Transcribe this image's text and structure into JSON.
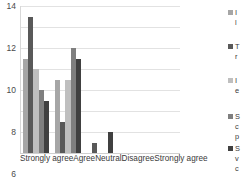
{
  "chart_data": {
    "type": "bar",
    "title": "",
    "subtitle": "",
    "xlabel": "",
    "ylabel": "",
    "categories": [
      "Strongly agree",
      "Agree",
      "Neutral",
      "Disagree",
      "Strongly agree"
    ],
    "ylim": [
      0,
      14
    ],
    "yticks": [
      0,
      2,
      4,
      6,
      8,
      10,
      12,
      14
    ],
    "grid": true,
    "legend_position": "right",
    "series": [
      {
        "name": "I",
        "label_lines": [
          "I",
          "l"
        ],
        "color": "#a6a6a6",
        "values": [
          9,
          7,
          0,
          0,
          0
        ]
      },
      {
        "name": "T",
        "label_lines": [
          "T",
          "r"
        ],
        "color": "#595959",
        "values": [
          13,
          3,
          1,
          0,
          0
        ]
      },
      {
        "name": "I",
        "label_lines": [
          "I",
          "e"
        ],
        "color": "#bfbfbf",
        "values": [
          8,
          7,
          0,
          0,
          0
        ]
      },
      {
        "name": "S",
        "label_lines": [
          "S",
          "c",
          "p"
        ],
        "color": "#7f7f7f",
        "values": [
          6,
          10,
          0,
          0,
          0
        ]
      },
      {
        "name": "S",
        "label_lines": [
          "S",
          "v",
          "c"
        ],
        "color": "#404040",
        "values": [
          5,
          9,
          2,
          0,
          0
        ]
      }
    ]
  },
  "axis": {
    "y_tick_0": "0",
    "y_tick_1": "2",
    "y_tick_2": "4",
    "y_tick_3": "6",
    "y_tick_4": "8",
    "y_tick_5": "10",
    "y_tick_6": "12",
    "y_tick_7": "14"
  }
}
